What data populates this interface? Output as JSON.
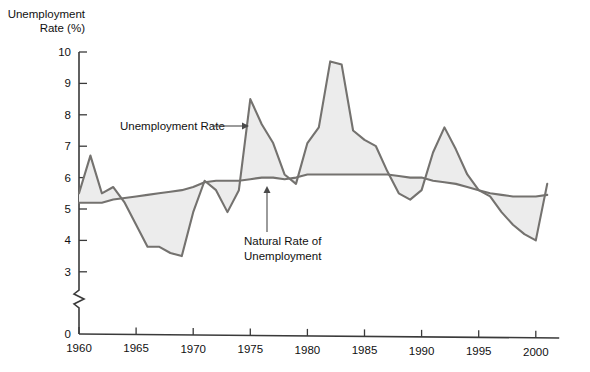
{
  "chart_data": {
    "type": "line",
    "title": "",
    "ylabel": "Unemployment Rate (%)",
    "xlabel": "",
    "ylim": [
      0,
      10
    ],
    "xlim": [
      1960,
      2001
    ],
    "grid": false,
    "legend": "none",
    "y_ticks": [
      0,
      3,
      4,
      5,
      6,
      7,
      8,
      9,
      10
    ],
    "y_axis_break": "between 0 and 3",
    "x_ticks": [
      1960,
      1965,
      1970,
      1975,
      1980,
      1985,
      1990,
      1995,
      2000
    ],
    "x_tick_labels": [
      "1960",
      "1965",
      "1970",
      "1975",
      "1980",
      "1985",
      "1990",
      "1995",
      "2000"
    ],
    "y_tick_labels": [
      "0",
      "3",
      "4",
      "5",
      "6",
      "7",
      "8",
      "9",
      "10"
    ],
    "annotations": [
      {
        "name": "unemployment-rate-annotation",
        "text": "Unemployment Rate",
        "text_x": 120,
        "text_y": 130,
        "arrow_from_x": 212,
        "arrow_from_y": 126,
        "arrow_to_x": 249,
        "arrow_to_y": 126,
        "direction": "right"
      },
      {
        "name": "natural-rate-annotation",
        "text_line1": "Natural Rate of",
        "text_line2": "Unemployment",
        "text_x": 244,
        "text_y": 245,
        "arrow_from_x": 267,
        "arrow_from_y": 232,
        "arrow_to_x": 267,
        "arrow_to_y": 186,
        "direction": "up"
      }
    ],
    "colors": {
      "fill": "#ececec",
      "line": "#74726f",
      "axis": "#3a3a3a",
      "text": "#111111"
    },
    "x": [
      1960,
      1961,
      1962,
      1963,
      1964,
      1965,
      1966,
      1967,
      1968,
      1969,
      1970,
      1971,
      1972,
      1973,
      1974,
      1975,
      1976,
      1977,
      1978,
      1979,
      1980,
      1981,
      1982,
      1983,
      1984,
      1985,
      1986,
      1987,
      1988,
      1989,
      1990,
      1991,
      1992,
      1993,
      1994,
      1995,
      1996,
      1997,
      1998,
      1999,
      2000,
      2001
    ],
    "series": [
      {
        "name": "Unemployment Rate",
        "values": [
          5.5,
          6.7,
          5.5,
          5.7,
          5.2,
          4.5,
          3.8,
          3.8,
          3.6,
          3.5,
          4.9,
          5.9,
          5.6,
          4.9,
          5.6,
          8.5,
          7.7,
          7.1,
          6.1,
          5.8,
          7.1,
          7.6,
          9.7,
          9.6,
          7.5,
          7.2,
          7.0,
          6.2,
          5.5,
          5.3,
          5.6,
          6.8,
          7.6,
          6.9,
          6.1,
          5.6,
          5.4,
          4.9,
          4.5,
          4.2,
          4.0,
          5.8
        ]
      },
      {
        "name": "Natural Rate of Unemployment",
        "values": [
          5.2,
          5.2,
          5.2,
          5.3,
          5.35,
          5.4,
          5.45,
          5.5,
          5.55,
          5.6,
          5.7,
          5.85,
          5.9,
          5.9,
          5.9,
          5.95,
          6.0,
          6.0,
          5.95,
          6.0,
          6.1,
          6.1,
          6.1,
          6.1,
          6.1,
          6.1,
          6.1,
          6.1,
          6.05,
          6.0,
          6.0,
          5.9,
          5.85,
          5.8,
          5.7,
          5.6,
          5.5,
          5.45,
          5.4,
          5.4,
          5.4,
          5.45
        ]
      }
    ]
  }
}
